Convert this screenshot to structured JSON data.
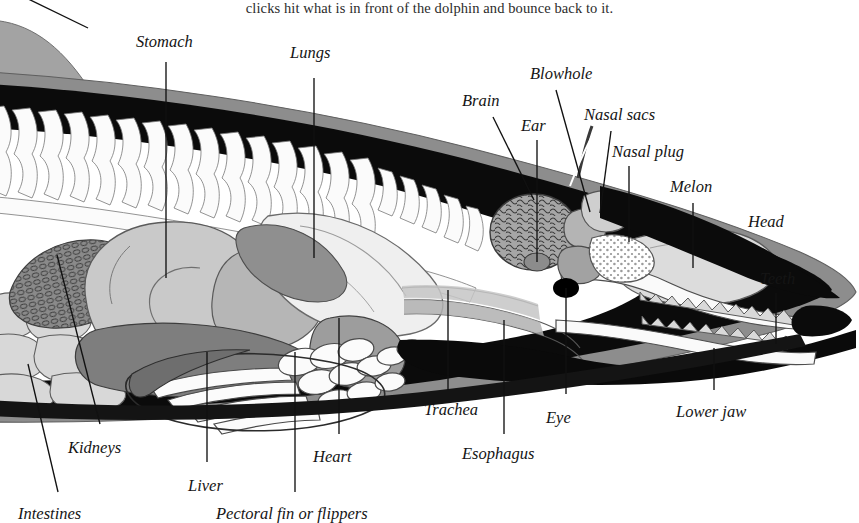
{
  "page": {
    "caption": "clicks hit what is in front of the dolphin and bounce back to it.",
    "width": 859,
    "height": 519,
    "background": "#ffffff",
    "ink": "#111111"
  },
  "figure": {
    "orientation": "left-tail to right-head lateral section",
    "palette": {
      "blubber_black": "#0b0b0b",
      "skin_gray": "#8d8d8d",
      "bone_white": "#fbfbfb",
      "organ_light": "#cfcfcf",
      "organ_mid": "#a8a8a8",
      "organ_dark": "#767676",
      "brain_gray": "#9a9a9a",
      "melon_light": "#dcdcdc",
      "eye_black": "#000000"
    }
  },
  "labels": [
    {
      "id": "stomach",
      "text": "Stomach",
      "x": 136,
      "y": 34,
      "lx": 166,
      "ly": 62,
      "tx": 166,
      "ty": 278
    },
    {
      "id": "lungs",
      "text": "Lungs",
      "x": 290,
      "y": 45,
      "lx": 314,
      "ly": 78,
      "tx": 314,
      "ty": 258
    },
    {
      "id": "blowhole",
      "text": "Blowhole",
      "x": 530,
      "y": 66,
      "lx": 556,
      "ly": 90,
      "tx": 590,
      "ty": 212
    },
    {
      "id": "brain",
      "text": "Brain",
      "x": 462,
      "y": 93,
      "lx": 493,
      "ly": 117,
      "tx": 534,
      "ty": 200
    },
    {
      "id": "ear",
      "text": "Ear",
      "x": 521,
      "y": 118,
      "lx": 537,
      "ly": 140,
      "tx": 537,
      "ty": 262
    },
    {
      "id": "nasal-sacs",
      "text": "Nasal sacs",
      "x": 584,
      "y": 107,
      "lx": 611,
      "ly": 131,
      "tx": 600,
      "ty": 213
    },
    {
      "id": "nasal-plug",
      "text": "Nasal plug",
      "x": 612,
      "y": 144,
      "lx": 629,
      "ly": 166,
      "tx": 629,
      "ty": 242
    },
    {
      "id": "melon",
      "text": "Melon",
      "x": 670,
      "y": 179,
      "lx": 693,
      "ly": 203,
      "tx": 693,
      "ty": 268
    },
    {
      "id": "head",
      "text": "Head",
      "x": 748,
      "y": 214,
      "lx": null,
      "ly": null,
      "tx": null,
      "ty": null
    },
    {
      "id": "teeth",
      "text": "Teeth",
      "x": 760,
      "y": 271,
      "lx": 776,
      "ly": 293,
      "tx": 776,
      "ty": 344
    },
    {
      "id": "trachea",
      "text": "Trachea",
      "x": 424,
      "y": 402,
      "lx": 448,
      "ly": 290,
      "tx": 448,
      "ly2": 390,
      "ty": 390
    },
    {
      "id": "esophagus",
      "text": "Esophagus",
      "x": 462,
      "y": 446,
      "lx": 504,
      "ly": 320,
      "tx": 504,
      "ty": 434
    },
    {
      "id": "eye",
      "text": "Eye",
      "x": 546,
      "y": 410,
      "lx": 566,
      "ly": 288,
      "tx": 566,
      "ty": 394
    },
    {
      "id": "lower-jaw",
      "text": "Lower jaw",
      "x": 676,
      "y": 404,
      "lx": 714,
      "ly": 348,
      "tx": 714,
      "ty": 390
    },
    {
      "id": "heart",
      "text": "Heart",
      "x": 313,
      "y": 449,
      "lx": 339,
      "ly": 318,
      "tx": 339,
      "ty": 434
    },
    {
      "id": "liver",
      "text": "Liver",
      "x": 188,
      "y": 478,
      "lx": 207,
      "ly": 352,
      "tx": 207,
      "ty": 462
    },
    {
      "id": "pectoral",
      "text": "Pectoral fin or flippers",
      "x": 216,
      "y": 506,
      "lx": 295,
      "ly": 352,
      "tx": 295,
      "ty": 492
    },
    {
      "id": "kidneys",
      "text": "Kidneys",
      "x": 68,
      "y": 440,
      "lx": 57,
      "ly": 255,
      "tx": 100,
      "ty": 424
    },
    {
      "id": "intestines",
      "text": "Intestines",
      "x": 18,
      "y": 506,
      "lx": 28,
      "ly": 364,
      "tx": 58,
      "ty": 492
    }
  ]
}
